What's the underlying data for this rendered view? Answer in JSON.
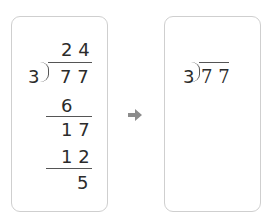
{
  "left_panel": {
    "quotient": "2 4",
    "divisor": "3",
    "dividend": "7 7",
    "steps": [
      {
        "value": "6"
      },
      {
        "value": "1 7"
      },
      {
        "value": "1 2"
      },
      {
        "value": "5"
      }
    ]
  },
  "arrow": {
    "icon": "right-arrow-icon",
    "color": "#8c8c8c"
  },
  "right_panel": {
    "divisor": "3",
    "dividend": "7 7"
  }
}
